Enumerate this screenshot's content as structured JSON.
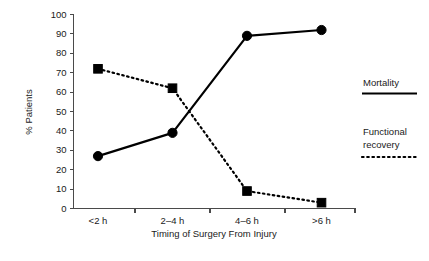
{
  "chart_data": {
    "type": "line",
    "title": "",
    "subtitle": "",
    "xlabel": "Timing of Surgery From Injury",
    "ylabel": "% Patients",
    "categories": [
      "<2 h",
      "2–4 h",
      "4–6 h",
      ">6 h"
    ],
    "ylim": [
      0,
      100
    ],
    "ytick_values": [
      0,
      10,
      20,
      30,
      40,
      50,
      60,
      70,
      80,
      90,
      100
    ],
    "ytick_labels": [
      "0",
      "10",
      "20",
      "30",
      "40",
      "50",
      "60",
      "70",
      "80",
      "90",
      "100"
    ],
    "grid": false,
    "legend_position": "right",
    "series": [
      {
        "name": "Mortality",
        "values": [
          27,
          39,
          89,
          92
        ],
        "line_style": "solid",
        "marker": "circle",
        "color": "#000000"
      },
      {
        "name": "Functional recovery",
        "values": [
          72,
          62,
          9,
          3
        ],
        "line_style": "dotted",
        "marker": "square",
        "color": "#000000"
      }
    ]
  },
  "legend": {
    "entries": [
      {
        "label": "Mortality",
        "style": "solid"
      },
      {
        "label_line1": "Functional",
        "label_line2": "recovery",
        "style": "dotted"
      }
    ]
  },
  "colors": {
    "ink": "#000000",
    "axis": "#4a4a4a",
    "background": "#ffffff"
  }
}
